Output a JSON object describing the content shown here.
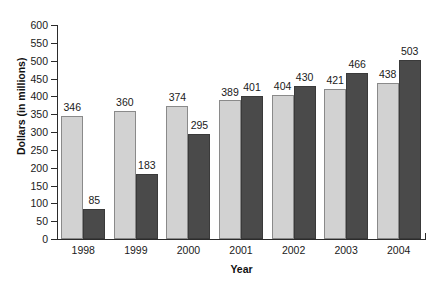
{
  "chart_data": {
    "type": "bar",
    "title": "",
    "xlabel": "Year",
    "ylabel": "Dollars (in millions)",
    "categories": [
      "1998",
      "1999",
      "2000",
      "2001",
      "2002",
      "2003",
      "2004"
    ],
    "series": [
      {
        "name": "series-light",
        "values": [
          346,
          360,
          374,
          389,
          404,
          421,
          438
        ]
      },
      {
        "name": "series-dark",
        "values": [
          85,
          183,
          295,
          401,
          430,
          466,
          503
        ]
      }
    ],
    "ylim": [
      0,
      600
    ],
    "ytick_step": 50,
    "yticks": [
      0,
      50,
      100,
      150,
      200,
      250,
      300,
      350,
      400,
      450,
      500,
      550,
      600
    ],
    "ytick_labels": [
      "0",
      "50",
      "100",
      "150",
      "200",
      "250",
      "300",
      "350",
      "400",
      "450",
      "500",
      "550",
      "600"
    ],
    "grid": false,
    "legend": "none",
    "colors": {
      "series_light": "#d2d2d2",
      "series_dark": "#4a4a4a",
      "axis": "#2b2b2b",
      "text": "#1a1a1a",
      "background": "#ffffff"
    }
  }
}
